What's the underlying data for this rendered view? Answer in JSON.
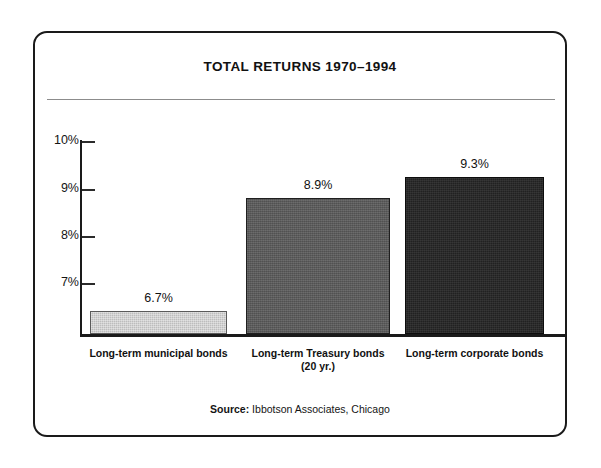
{
  "chart_data": {
    "type": "bar",
    "title": "TOTAL RETURNS 1970–1994",
    "xlabel": "",
    "ylabel": "",
    "ylim": [
      6.25,
      10
    ],
    "ytick_labels": [
      "10%",
      "9%",
      "8%",
      "7%"
    ],
    "ytick_values": [
      10,
      9,
      8,
      7
    ],
    "grid": false,
    "legend": "none",
    "categories": [
      "Long-term municipal bonds",
      "Long-term Treasury bonds (20 yr.)",
      "Long-term corporate bonds"
    ],
    "category_lines": [
      [
        "Long-term municipal bonds"
      ],
      [
        "Long-term Treasury bonds",
        "(20 yr.)"
      ],
      [
        "Long-term corporate bonds"
      ]
    ],
    "values": [
      6.7,
      8.9,
      9.3
    ],
    "value_labels": [
      "6.7%",
      "8.9%",
      "9.3%"
    ],
    "bar_colors": [
      "#bdbdbd",
      "#585858",
      "#242424"
    ],
    "source": {
      "label": "Source:",
      "text": " Ibbotson Associates, Chicago"
    }
  }
}
